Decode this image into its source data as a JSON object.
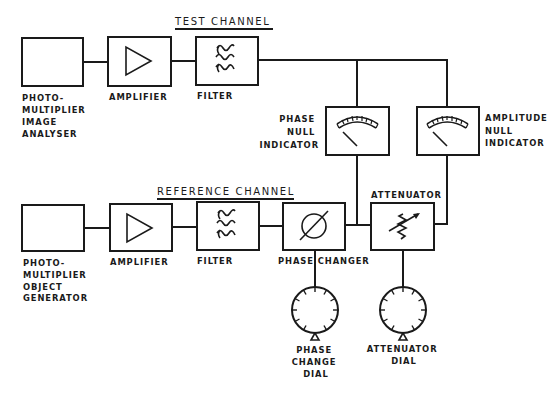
{
  "diagram": {
    "colors": {
      "ink": "#1a1a1a",
      "background": "#ffffff"
    },
    "test_channel": {
      "title": "TEST CHANNEL",
      "blocks": [
        {
          "id": "pm-image-analyser",
          "icon": "empty-box",
          "label_lines": [
            "PHOTO-",
            "MULTIPLIER",
            "IMAGE",
            "ANALYSER"
          ]
        },
        {
          "id": "test-amplifier",
          "icon": "amplifier-triangle-icon",
          "label_lines": [
            "AMPLIFIER"
          ]
        },
        {
          "id": "test-filter",
          "icon": "filter-waves-icon",
          "label_lines": [
            "FILTER"
          ]
        }
      ]
    },
    "indicators": [
      {
        "id": "phase-null-indicator",
        "icon": "meter-icon",
        "label_lines": [
          "PHASE",
          "NULL",
          "INDICATOR"
        ]
      },
      {
        "id": "amplitude-null-indicator",
        "icon": "meter-icon",
        "label_lines": [
          "AMPLITUDE",
          "NULL",
          "INDICATOR"
        ]
      }
    ],
    "reference_channel": {
      "title": "REFERENCE CHANNEL",
      "blocks": [
        {
          "id": "pm-object-generator",
          "icon": "empty-box",
          "label_lines": [
            "PHOTO-",
            "MULTIPLIER",
            "OBJECT",
            "GENERATOR"
          ]
        },
        {
          "id": "ref-amplifier",
          "icon": "amplifier-triangle-icon",
          "label_lines": [
            "AMPLIFIER"
          ]
        },
        {
          "id": "ref-filter",
          "icon": "filter-waves-icon",
          "label_lines": [
            "FILTER"
          ]
        },
        {
          "id": "phase-changer",
          "icon": "phase-slashed-circle-icon",
          "label_lines": [
            "PHASE CHANGER"
          ]
        },
        {
          "id": "attenuator",
          "icon": "variable-resistor-icon",
          "label_lines": [
            "ATTENUATOR"
          ]
        }
      ]
    },
    "dials": [
      {
        "id": "phase-change-dial",
        "icon": "dial-icon",
        "label_lines": [
          "PHASE",
          "CHANGE",
          "DIAL"
        ]
      },
      {
        "id": "attenuator-dial",
        "icon": "dial-icon",
        "label_lines": [
          "ATTENUATOR",
          "DIAL"
        ]
      }
    ]
  }
}
